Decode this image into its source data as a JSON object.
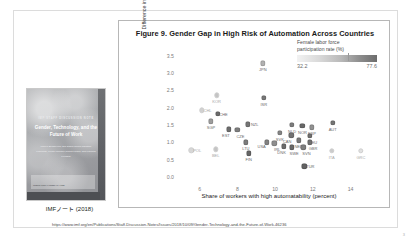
{
  "slide": {
    "source_url": "https://www.imf.org/en/Publications/Staff-Discussion-Notes/Issues/2018/10/09/Gender-Technology-and-the-Future-of-Work-46236",
    "page_number": "3"
  },
  "cover": {
    "eyebrow": "IMF STAFF DISCUSSION NOTE",
    "title": "Gender, Technology, and the Future of Work",
    "authors": "Mariya Brussevich, Era Dabla-Norris,\nChristine Kamunge, Pooja Karnane,\nSalma Khalid, and Kalpana Kochhar",
    "footer_note": "INTERNATIONAL MONETARY FUND",
    "caption": "IMFノート (2018)"
  },
  "chart_data": {
    "type": "scatter",
    "title": "Figure 9. Gender Gap in High Risk of Automation Across Countries",
    "xlabel": "Share of workers with high automatability (percent)",
    "ylabel": "Difference in automatability (female vs. male)",
    "xlim": [
      4.8,
      15.4
    ],
    "ylim": [
      -0.15,
      3.75
    ],
    "xticks": [
      "6",
      "8",
      "10",
      "12",
      "14"
    ],
    "xtick_values": [
      6,
      8,
      10,
      12,
      14
    ],
    "yticks": [
      "0.0",
      "0.5",
      "1.0",
      "1.5",
      "2.0",
      "2.5",
      "3.0",
      "3.5"
    ],
    "ytick_values": [
      0.0,
      0.5,
      1.0,
      1.5,
      2.0,
      2.5,
      3.0,
      3.5
    ],
    "grid": false,
    "colorbar": {
      "title": "Female labor force\nparticipation rate (%)",
      "min_label": "32.2",
      "max_label": "77.6",
      "min_value": 32.2,
      "max_value": 77.6,
      "low_color": "#f2f2f2",
      "high_color": "#6d6d6d"
    },
    "points": [
      {
        "code": "JPN",
        "x": 9.35,
        "y": 3.28,
        "shade": 0.42,
        "lx": 0,
        "ly": 4
      },
      {
        "code": "KOR",
        "x": 6.9,
        "y": 2.35,
        "shade": 0.3,
        "lx": 0,
        "ly": 4
      },
      {
        "code": "ISR",
        "x": 9.4,
        "y": 2.28,
        "shade": 0.78,
        "lx": 0,
        "ly": 4
      },
      {
        "code": "CHL",
        "x": 6.1,
        "y": 1.92,
        "shade": 0.22,
        "lx": 6,
        "ly": -2
      },
      {
        "code": "CHE",
        "x": 6.95,
        "y": 1.82,
        "shade": 0.86,
        "lx": 6,
        "ly": -2
      },
      {
        "code": "SGP",
        "x": 6.6,
        "y": 1.6,
        "shade": 0.55,
        "lx": 0,
        "ly": 4
      },
      {
        "code": "NZL",
        "x": 8.55,
        "y": 1.52,
        "shade": 0.8,
        "lx": 7,
        "ly": -2
      },
      {
        "code": "NLD",
        "x": 10.9,
        "y": 1.5,
        "shade": 0.75,
        "lx": 0,
        "ly": 4
      },
      {
        "code": "NOR",
        "x": 11.45,
        "y": 1.47,
        "shade": 0.88,
        "lx": 0,
        "ly": 4
      },
      {
        "code": "ESP",
        "x": 11.95,
        "y": 1.43,
        "shade": 0.62,
        "lx": 0,
        "ly": 4
      },
      {
        "code": "AUT",
        "x": 13.05,
        "y": 1.56,
        "shade": 0.8,
        "lx": 0,
        "ly": 4
      },
      {
        "code": "EST",
        "x": 7.55,
        "y": 1.37,
        "shade": 0.85,
        "lx": -3,
        "ly": 4
      },
      {
        "code": "CZE",
        "x": 8.0,
        "y": 1.35,
        "shade": 0.74,
        "lx": 3,
        "ly": 4
      },
      {
        "code": "SVK",
        "x": 10.25,
        "y": 1.28,
        "shade": 0.7,
        "lx": 0,
        "ly": 4
      },
      {
        "code": "CAN",
        "x": 10.85,
        "y": 1.2,
        "shade": 0.82,
        "lx": -4,
        "ly": 4
      },
      {
        "code": "DEU",
        "x": 11.85,
        "y": 1.18,
        "shade": 0.84,
        "lx": 3,
        "ly": 4
      },
      {
        "code": "NED",
        "x": 11.25,
        "y": 1.05,
        "shade": 0.78,
        "lx": 0,
        "ly": 4
      },
      {
        "code": "GBR",
        "x": 11.85,
        "y": 1.0,
        "shade": 0.83,
        "lx": 3,
        "ly": 4
      },
      {
        "code": "USA",
        "x": 9.55,
        "y": 1.0,
        "shade": 0.72,
        "lx": -5,
        "ly": 2
      },
      {
        "code": "IRL",
        "x": 9.95,
        "y": 0.97,
        "shade": 0.64,
        "lx": 3,
        "ly": 4
      },
      {
        "code": "LTU",
        "x": 8.45,
        "y": 1.0,
        "shade": 0.76,
        "lx": 0,
        "ly": 4
      },
      {
        "code": "DNK",
        "x": 10.45,
        "y": 0.88,
        "shade": 0.86,
        "lx": -2,
        "ly": 4
      },
      {
        "code": "SWE",
        "x": 10.9,
        "y": 0.85,
        "shade": 0.88,
        "lx": 2,
        "ly": 4
      },
      {
        "code": "SVN",
        "x": 11.5,
        "y": 0.85,
        "shade": 0.74,
        "lx": 3,
        "ly": 4
      },
      {
        "code": "POL",
        "x": 5.55,
        "y": 0.77,
        "shade": 0.18,
        "lx": 6,
        "ly": -2
      },
      {
        "code": "BEL",
        "x": 6.85,
        "y": 0.8,
        "shade": 0.3,
        "lx": 0,
        "ly": 4
      },
      {
        "code": "FIN",
        "x": 8.6,
        "y": 0.68,
        "shade": 0.9,
        "lx": 0,
        "ly": 4
      },
      {
        "code": "TUR",
        "x": 11.55,
        "y": 0.3,
        "shade": 0.92,
        "lx": 6,
        "ly": -2
      },
      {
        "code": "ITA",
        "x": 13.0,
        "y": 0.75,
        "shade": 0.26,
        "lx": 0,
        "ly": 4
      },
      {
        "code": "GRC",
        "x": 14.55,
        "y": 0.75,
        "shade": 0.12,
        "lx": 0,
        "ly": 4
      }
    ]
  }
}
